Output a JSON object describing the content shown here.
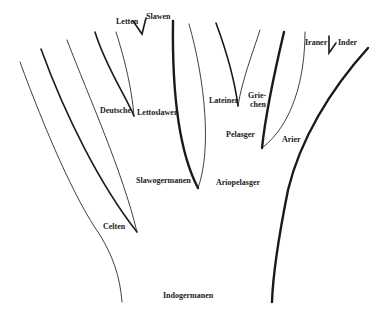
{
  "diagram": {
    "type": "language-family-tree",
    "root": "Indogermanen",
    "labels": {
      "letten": "Letten",
      "slawen": "Slawen",
      "iraner": "Iraner",
      "inder": "Inder",
      "deutsche": "Deutsche",
      "lettoslawen": "Lettoslawen",
      "lateiner": "Lateiner",
      "griechen_1": "Grie-",
      "griechen_2": "chen",
      "pelasger": "Pelasger",
      "arier": "Arier",
      "slawogermanen": "Slawogermanen",
      "ariopelasger": "Ariopelasger",
      "celten": "Celten",
      "indogermanen": "Indogermanen"
    },
    "edges": [
      {
        "from": "Indogermanen",
        "to": "Celten"
      },
      {
        "from": "Indogermanen",
        "to": "Slawogermanen"
      },
      {
        "from": "Indogermanen",
        "to": "Ariopelasger"
      },
      {
        "from": "Slawogermanen",
        "to": "Deutsche"
      },
      {
        "from": "Slawogermanen",
        "to": "Lettoslawen"
      },
      {
        "from": "Lettoslawen",
        "to": "Letten"
      },
      {
        "from": "Lettoslawen",
        "to": "Slawen"
      },
      {
        "from": "Ariopelasger",
        "to": "Pelasger"
      },
      {
        "from": "Ariopelasger",
        "to": "Arier"
      },
      {
        "from": "Pelasger",
        "to": "Lateiner"
      },
      {
        "from": "Pelasger",
        "to": "Griechen"
      },
      {
        "from": "Arier",
        "to": "Iraner"
      },
      {
        "from": "Arier",
        "to": "Inder"
      }
    ],
    "colors": {
      "ink": "#1a1a1a",
      "background": "#ffffff"
    }
  }
}
